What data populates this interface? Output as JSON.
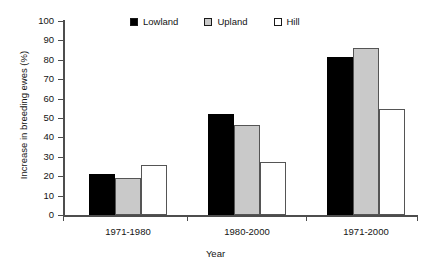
{
  "chart_data": {
    "type": "bar",
    "title": "",
    "xlabel": "Year",
    "ylabel": "Increase in breeding ewes (%)",
    "categories": [
      "1971-1980",
      "1980-2000",
      "1971-2000"
    ],
    "series": [
      {
        "name": "Lowland",
        "values": [
          21,
          52,
          81.5
        ],
        "color": "#000000"
      },
      {
        "name": "Upland",
        "values": [
          19,
          46.5,
          86
        ],
        "color": "#c9c9c9"
      },
      {
        "name": "Hill",
        "values": [
          26,
          27.5,
          54.5
        ],
        "color": "#ffffff"
      }
    ],
    "ylim": [
      0,
      100
    ],
    "ytick_labels": [
      "100",
      "90",
      "80",
      "70",
      "60",
      "50",
      "40",
      "30",
      "20",
      "10",
      "0"
    ],
    "ytick_values": [
      100,
      90,
      80,
      70,
      60,
      50,
      40,
      30,
      20,
      10,
      0
    ],
    "grid": false,
    "legend_position": "top-center",
    "legend_entries": [
      "Lowland",
      "Upland",
      "Hill"
    ]
  },
  "axes": {
    "y_title": "Increase in breeding ewes (%)",
    "x_title": "Year"
  },
  "legend": {
    "items": [
      {
        "label": "Lowland",
        "swatch": "filled-black-square-icon"
      },
      {
        "label": "Upland",
        "swatch": "filled-gray-square-icon"
      },
      {
        "label": "Hill",
        "swatch": "empty-white-square-icon"
      }
    ]
  }
}
